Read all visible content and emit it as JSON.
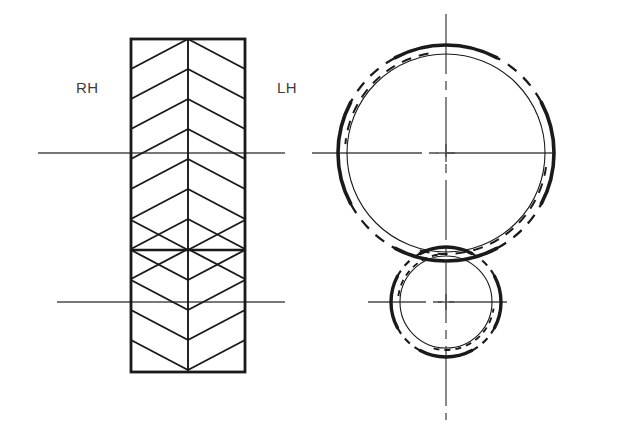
{
  "drawing": {
    "title": "Double Helical (Herringbone) Gear Pair",
    "canvas": {
      "width": 621,
      "height": 431,
      "background": "#ffffff"
    },
    "colors": {
      "outline": "#1a1a1a",
      "hatch": "#1a1a1a",
      "centerline": "#4a4a4a",
      "thin": "#1a1a1a",
      "label": "#3d3d3d"
    },
    "labels": {
      "right_hand": "RH",
      "left_hand": "LH"
    },
    "label_positions": {
      "right_hand": {
        "x": 76,
        "y": 93
      },
      "left_hand": {
        "x": 277,
        "y": 93
      }
    },
    "front_view": {
      "name": "front-section-view",
      "rect": {
        "x": 131,
        "y": 39,
        "width": 114,
        "height": 333
      },
      "center_x": 188,
      "reversal_y": 250,
      "upper_chevron_direction": "up",
      "lower_chevron_direction": "down",
      "chevron_pitch": 30,
      "upper_apex_y": [
        39,
        69,
        99,
        129,
        159,
        189,
        219,
        250
      ],
      "lower_apex_y": [
        250,
        280,
        310,
        340,
        372
      ],
      "axis_upper": {
        "y": 153,
        "x1": 38,
        "x2": 285
      },
      "axis_lower": {
        "y": 302,
        "x1": 57,
        "x2": 285
      }
    },
    "end_view": {
      "name": "end-view",
      "large_gear": {
        "center": {
          "x": 446,
          "y": 153
        },
        "outer_radius": 108,
        "inner_radius": 99,
        "thick_stroke": 3.6,
        "thin_stroke": 1.1,
        "dash_gaps_deg": [
          [
            118,
            152
          ],
          [
            28,
            62
          ],
          [
            208,
            242
          ],
          [
            298,
            332
          ]
        ]
      },
      "small_gear": {
        "center": {
          "x": 446,
          "y": 302
        },
        "outer_radius": 55,
        "inner_radius": 46,
        "thick_stroke": 3.4,
        "thin_stroke": 1.1,
        "dash_gaps_deg": [
          [
            118,
            152
          ],
          [
            28,
            62
          ],
          [
            208,
            242
          ],
          [
            298,
            332
          ]
        ]
      },
      "centerline_vertical": {
        "x": 446,
        "y1": 14,
        "y2": 420
      },
      "centerline_large_horizontal": {
        "y": 153,
        "x1": 312,
        "x2": 584
      },
      "centerline_small_horizontal": {
        "y": 302,
        "x1": 368,
        "x2": 528
      }
    }
  }
}
